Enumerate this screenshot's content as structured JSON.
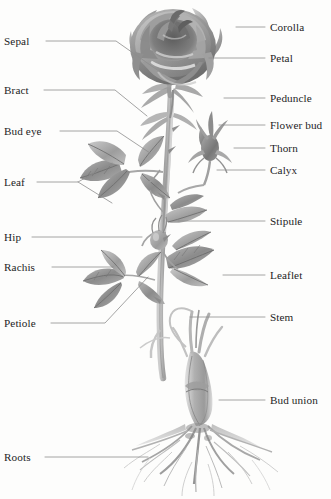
{
  "figure": {
    "width": 331,
    "height": 499,
    "background_color": "#fdfdfc",
    "text_color": "#1d1d1f",
    "leader_line_color": "#8d8d8d",
    "art_style": "grayscale-pencil-illustration"
  },
  "labels": {
    "left": [
      {
        "id": "sepal",
        "text": "Sepal",
        "x": 4,
        "y": 36,
        "leader": "M 46,41 L 116,41 L 163,74"
      },
      {
        "id": "bract",
        "text": "Bract",
        "x": 4,
        "y": 85,
        "leader": "M 44,90 L 115,90 L 147,116"
      },
      {
        "id": "bud-eye",
        "text": "Bud eye",
        "x": 4,
        "y": 126,
        "leader": "M 60,131 L 117,131 L 150,153"
      },
      {
        "id": "leaf",
        "text": "Leaf",
        "x": 4,
        "y": 177,
        "leader": "M 37,182 L 78,182 L 112,163 M 78,182 L 112,203"
      },
      {
        "id": "hip",
        "text": "Hip",
        "x": 4,
        "y": 232,
        "leader": "M 32,237 L 142,237"
      },
      {
        "id": "rachis",
        "text": "Rachis",
        "x": 4,
        "y": 262,
        "leader": "M 52,267 L 113,267"
      },
      {
        "id": "petiole",
        "text": "Petiole",
        "x": 4,
        "y": 318,
        "leader": "M 51,323 L 105,323 L 148,277"
      },
      {
        "id": "roots",
        "text": "Roots",
        "x": 4,
        "y": 452,
        "leader": "M 45,457 L 148,457"
      }
    ],
    "right": [
      {
        "id": "corolla",
        "text": "Corolla",
        "x": 270,
        "y": 22,
        "leader": "M 236,27 L 265,27"
      },
      {
        "id": "petal",
        "text": "Petal",
        "x": 270,
        "y": 53,
        "leader": "M 209,58 L 265,58"
      },
      {
        "id": "peduncle",
        "text": "Peduncle",
        "x": 270,
        "y": 93,
        "leader": "M 224,98 L 265,98"
      },
      {
        "id": "flower-bud",
        "text": "Flower bud",
        "x": 270,
        "y": 120,
        "leader": "M 219,125 L 265,125"
      },
      {
        "id": "thorn",
        "text": "Thorn",
        "x": 270,
        "y": 143,
        "leader": "M 234,148 L 265,148"
      },
      {
        "id": "calyx",
        "text": "Calyx",
        "x": 270,
        "y": 165,
        "leader": "M 217,170 L 265,170"
      },
      {
        "id": "stipule",
        "text": "Stipule",
        "x": 270,
        "y": 216,
        "leader": "M 178,221 L 265,221"
      },
      {
        "id": "leaflet",
        "text": "Leaflet",
        "x": 270,
        "y": 270,
        "leader": "M 223,275 L 265,275"
      },
      {
        "id": "stem",
        "text": "Stem",
        "x": 270,
        "y": 312,
        "leader": "M 190,317 L 265,317"
      },
      {
        "id": "bud-union",
        "text": "Bud union",
        "x": 270,
        "y": 395,
        "leader": "M 219,400 L 265,400"
      }
    ]
  }
}
